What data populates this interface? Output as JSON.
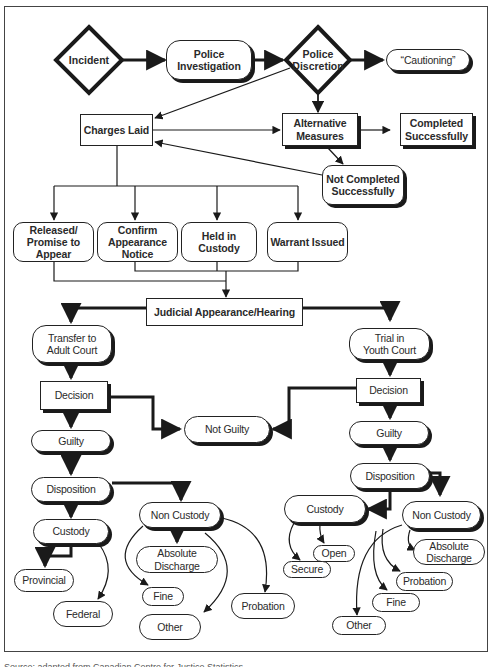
{
  "diagram": {
    "type": "flowchart",
    "topic": "Youth criminal justice process",
    "nodes": {
      "incident": "Incident",
      "police_investigation": "Police\nInvestigation",
      "police_discretion": "Police\nDiscretion",
      "cautioning": "“Cautioning”",
      "charges_laid": "Charges Laid",
      "alternative_measures": "Alternative\nMeasures",
      "completed_successfully": "Completed\nSuccessfully",
      "not_completed_successfully": "Not Completed\nSuccessfully",
      "released_promise": "Released/\nPromise to\nAppear",
      "confirm_appearance": "Confirm\nAppearance\nNotice",
      "held_in_custody": "Held in\nCustody",
      "warrant_issued": "Warrant Issued",
      "judicial_appearance": "Judicial Appearance/Hearing",
      "transfer_adult": "Transfer to\nAdult Court",
      "trial_youth": "Trial in\nYouth Court",
      "decision_left": "Decision",
      "decision_right": "Decision",
      "not_guilty": "Not Guilty",
      "guilty_left": "Guilty",
      "guilty_right": "Guilty",
      "disposition_left": "Disposition",
      "disposition_right": "Disposition",
      "custody_left": "Custody",
      "non_custody_left": "Non Custody",
      "provincial": "Provincial",
      "federal": "Federal",
      "absolute_discharge_left": "Absolute\nDischarge",
      "fine_left": "Fine",
      "other_left": "Other",
      "probation_left": "Probation",
      "custody_right": "Custody",
      "open": "Open",
      "secure": "Secure",
      "non_custody_right": "Non Custody",
      "absolute_discharge_right": "Absolute\nDischarge",
      "probation_right": "Probation",
      "fine_right": "Fine",
      "other_right": "Other"
    },
    "edges": [
      [
        "incident",
        "police_investigation"
      ],
      [
        "police_investigation",
        "police_discretion"
      ],
      [
        "police_discretion",
        "cautioning"
      ],
      [
        "police_discretion",
        "charges_laid"
      ],
      [
        "police_discretion",
        "alternative_measures"
      ],
      [
        "charges_laid",
        "alternative_measures"
      ],
      [
        "alternative_measures",
        "completed_successfully"
      ],
      [
        "alternative_measures",
        "not_completed_successfully"
      ],
      [
        "not_completed_successfully",
        "charges_laid"
      ],
      [
        "charges_laid",
        "released_promise"
      ],
      [
        "charges_laid",
        "confirm_appearance"
      ],
      [
        "charges_laid",
        "held_in_custody"
      ],
      [
        "charges_laid",
        "warrant_issued"
      ],
      [
        "released_promise",
        "judicial_appearance"
      ],
      [
        "confirm_appearance",
        "judicial_appearance"
      ],
      [
        "held_in_custody",
        "judicial_appearance"
      ],
      [
        "warrant_issued",
        "judicial_appearance"
      ],
      [
        "judicial_appearance",
        "transfer_adult"
      ],
      [
        "judicial_appearance",
        "trial_youth"
      ],
      [
        "transfer_adult",
        "decision_left"
      ],
      [
        "decision_left",
        "not_guilty"
      ],
      [
        "decision_left",
        "guilty_left"
      ],
      [
        "trial_youth",
        "decision_right"
      ],
      [
        "decision_right",
        "not_guilty"
      ],
      [
        "decision_right",
        "guilty_right"
      ],
      [
        "guilty_left",
        "disposition_left"
      ],
      [
        "disposition_left",
        "custody_left"
      ],
      [
        "disposition_left",
        "non_custody_left"
      ],
      [
        "custody_left",
        "provincial"
      ],
      [
        "custody_left",
        "federal"
      ],
      [
        "non_custody_left",
        "absolute_discharge_left"
      ],
      [
        "non_custody_left",
        "fine_left"
      ],
      [
        "non_custody_left",
        "other_left"
      ],
      [
        "non_custody_left",
        "probation_left"
      ],
      [
        "guilty_right",
        "disposition_right"
      ],
      [
        "disposition_right",
        "custody_right"
      ],
      [
        "disposition_right",
        "non_custody_right"
      ],
      [
        "custody_right",
        "open"
      ],
      [
        "custody_right",
        "secure"
      ],
      [
        "non_custody_right",
        "absolute_discharge_right"
      ],
      [
        "non_custody_right",
        "probation_right"
      ],
      [
        "non_custody_right",
        "fine_right"
      ],
      [
        "non_custody_right",
        "other_right"
      ]
    ]
  },
  "caption": "Source: adapted from Canadian Centre for Justice Statistics"
}
